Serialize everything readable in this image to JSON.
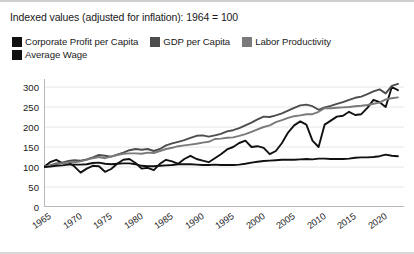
{
  "chart_data": {
    "type": "line",
    "title": "Indexed values (adjusted for inflation): 1964 = 100",
    "xlabel": "",
    "ylabel": "",
    "xlim": [
      1964,
      2023
    ],
    "ylim": [
      0,
      320
    ],
    "grid": true,
    "grid_axis": "y",
    "legend_position": "top-left",
    "yticks": [
      0,
      50,
      100,
      150,
      200,
      250,
      300
    ],
    "ytick_labels": [
      "0",
      "50",
      "100",
      "150",
      "200",
      "250",
      "300"
    ],
    "xticks": [
      1965,
      1970,
      1975,
      1980,
      1985,
      1990,
      1995,
      2000,
      2005,
      2010,
      2015,
      2020
    ],
    "xtick_labels": [
      "1965",
      "1970",
      "1975",
      "1980",
      "1985",
      "1990",
      "1995",
      "2000",
      "2005",
      "2010",
      "2015",
      "2020"
    ],
    "x": [
      1964,
      1965,
      1966,
      1967,
      1968,
      1969,
      1970,
      1971,
      1972,
      1973,
      1974,
      1975,
      1976,
      1977,
      1978,
      1979,
      1980,
      1981,
      1982,
      1983,
      1984,
      1985,
      1986,
      1987,
      1988,
      1989,
      1990,
      1991,
      1992,
      1993,
      1994,
      1995,
      1996,
      1997,
      1998,
      1999,
      2000,
      2001,
      2002,
      2003,
      2004,
      2005,
      2006,
      2007,
      2008,
      2009,
      2010,
      2011,
      2012,
      2013,
      2014,
      2015,
      2016,
      2017,
      2018,
      2019,
      2020,
      2021,
      2022
    ],
    "series": [
      {
        "name": "Corporate Profit per Capita",
        "color": "#111111",
        "width": 1.9,
        "values": [
          100,
          112,
          118,
          110,
          112,
          101,
          86,
          96,
          103,
          102,
          88,
          95,
          108,
          118,
          120,
          110,
          96,
          98,
          92,
          108,
          118,
          114,
          108,
          120,
          128,
          120,
          116,
          112,
          122,
          132,
          144,
          150,
          160,
          166,
          150,
          152,
          148,
          132,
          140,
          160,
          186,
          204,
          214,
          206,
          166,
          150,
          206,
          216,
          226,
          228,
          238,
          230,
          232,
          248,
          268,
          262,
          250,
          300,
          292
        ]
      },
      {
        "name": "GDP per Capita",
        "color": "#4d4d4d",
        "width": 1.9,
        "values": [
          100,
          104,
          109,
          111,
          115,
          117,
          116,
          119,
          124,
          130,
          128,
          126,
          131,
          136,
          142,
          145,
          143,
          145,
          140,
          145,
          154,
          159,
          163,
          167,
          173,
          178,
          179,
          176,
          179,
          183,
          189,
          192,
          197,
          204,
          211,
          219,
          226,
          225,
          229,
          234,
          241,
          248,
          254,
          256,
          252,
          243,
          249,
          253,
          258,
          262,
          268,
          273,
          276,
          282,
          289,
          294,
          284,
          303,
          308
        ]
      },
      {
        "name": "Labor Productivity",
        "color": "#7a7a7a",
        "width": 1.9,
        "values": [
          100,
          103,
          107,
          109,
          112,
          112,
          114,
          118,
          122,
          125,
          122,
          126,
          130,
          133,
          134,
          134,
          133,
          136,
          135,
          140,
          145,
          148,
          152,
          154,
          156,
          158,
          161,
          163,
          170,
          171,
          173,
          174,
          178,
          182,
          188,
          194,
          200,
          204,
          212,
          217,
          223,
          227,
          229,
          232,
          232,
          238,
          247,
          247,
          248,
          249,
          250,
          252,
          253,
          255,
          258,
          261,
          269,
          272,
          274
        ]
      },
      {
        "name": "Average Wage",
        "color": "#111111",
        "width": 1.9,
        "values": [
          100,
          101,
          103,
          104,
          106,
          106,
          106,
          107,
          110,
          111,
          108,
          107,
          108,
          109,
          109,
          107,
          103,
          102,
          102,
          103,
          104,
          105,
          107,
          107,
          107,
          106,
          105,
          105,
          106,
          105,
          105,
          105,
          106,
          108,
          111,
          113,
          115,
          116,
          117,
          118,
          118,
          118,
          119,
          120,
          119,
          121,
          121,
          120,
          120,
          120,
          121,
          123,
          124,
          124,
          125,
          127,
          131,
          128,
          127
        ]
      }
    ]
  },
  "axis": {
    "axis_color": "#b8b8b8",
    "grid_color": "#e6e6e6"
  }
}
